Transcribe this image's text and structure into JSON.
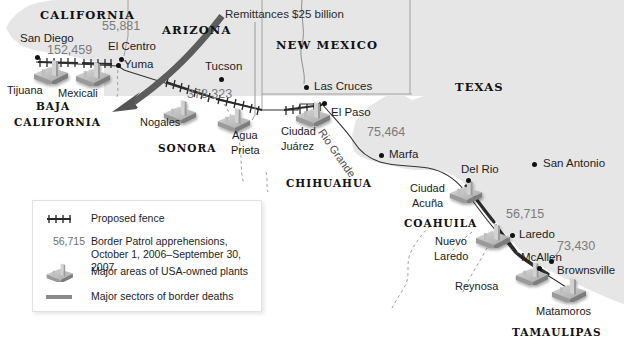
{
  "figure": {
    "kind": "thematic-map",
    "region": "USA-Mexico border",
    "background_color": "#ffffff",
    "us_land_color": "#e6e6e6",
    "mexico_land_color": "#ffffff",
    "accent_gray": "#7b7b7b",
    "border_line_color": "#2b2b2b",
    "arrow_color": "#5e5e5e"
  },
  "annotations": {
    "remittances": "Remittances $25 billion",
    "river": "Rio Grande"
  },
  "us_states": [
    {
      "name": "CALIFORNIA",
      "x": 40,
      "y": 10
    },
    {
      "name": "ARIZONA",
      "x": 160,
      "y": 25
    },
    {
      "name": "NEW MEXICO",
      "x": 278,
      "y": 40
    },
    {
      "name": "TEXAS",
      "x": 455,
      "y": 82
    }
  ],
  "mx_states": [
    {
      "name": "BAJA",
      "x": 34,
      "y": 101
    },
    {
      "name": "CALIFORNIA",
      "x": 14,
      "y": 116
    },
    {
      "name": "SONORA",
      "x": 158,
      "y": 142
    },
    {
      "name": "CHIHUAHUA",
      "x": 286,
      "y": 178
    },
    {
      "name": "COAHUILA",
      "x": 404,
      "y": 218
    },
    {
      "name": "TAMAULIPAS",
      "x": 514,
      "y": 327
    }
  ],
  "us_cities": [
    {
      "name": "San Diego",
      "x": 21,
      "y": 33,
      "dot_x": 35,
      "dot_y": 55
    },
    {
      "name": "El Centro",
      "x": 108,
      "y": 41,
      "dot_x": 119,
      "dot_y": 57
    },
    {
      "name": "Yuma",
      "x": 124,
      "y": 60,
      "dot_x": 117,
      "dot_y": 65
    },
    {
      "name": "Tucson",
      "x": 206,
      "y": 62,
      "dot_x": 219,
      "dot_y": 77
    },
    {
      "name": "Las Cruces",
      "x": 315,
      "y": 82,
      "dot_x": 305,
      "dot_y": 87
    },
    {
      "name": "El Paso",
      "x": 331,
      "y": 108,
      "dot_x": 323,
      "dot_y": 101
    },
    {
      "name": "Marfa",
      "x": 389,
      "y": 149,
      "dot_x": 380,
      "dot_y": 154
    },
    {
      "name": "Del Rio",
      "x": 461,
      "y": 165,
      "dot_x": 465,
      "dot_y": 178
    },
    {
      "name": "San Antonio",
      "x": 543,
      "y": 159,
      "dot_x": 532,
      "dot_y": 164
    },
    {
      "name": "Laredo",
      "x": 519,
      "y": 230,
      "dot_x": 510,
      "dot_y": 235
    },
    {
      "name": "McAllen",
      "x": 523,
      "y": 252,
      "dot_x": 537,
      "dot_y": 266
    },
    {
      "name": "Brownsville",
      "x": 559,
      "y": 265,
      "dot_x": 551,
      "dot_y": 260
    }
  ],
  "mx_cities": [
    {
      "name": "Tijuana",
      "x": 8,
      "y": 85
    },
    {
      "name": "Mexicali",
      "x": 58,
      "y": 88
    },
    {
      "name": "Nogales",
      "x": 141,
      "y": 117
    },
    {
      "name": "Agua",
      "x": 232,
      "y": 130
    },
    {
      "name": "Prieta",
      "x": 231,
      "y": 144
    },
    {
      "name": "Ciudad",
      "x": 281,
      "y": 126
    },
    {
      "name": "Juárez",
      "x": 281,
      "y": 140
    },
    {
      "name": "Ciudad",
      "x": 412,
      "y": 183
    },
    {
      "name": "Acuña",
      "x": 414,
      "y": 197
    },
    {
      "name": "Nuevo",
      "x": 437,
      "y": 236
    },
    {
      "name": "Laredo",
      "x": 436,
      "y": 250
    },
    {
      "name": "Reynosa",
      "x": 457,
      "y": 281
    },
    {
      "name": "Matamoros",
      "x": 538,
      "y": 306
    }
  ],
  "apprehension_numbers": [
    {
      "value": "152,459",
      "x": 47,
      "y": 45
    },
    {
      "value": "55,881",
      "x": 103,
      "y": 21
    },
    {
      "value": "378,323",
      "x": 188,
      "y": 89
    },
    {
      "value": "75,464",
      "x": 368,
      "y": 127
    },
    {
      "value": "56,715",
      "x": 508,
      "y": 209
    },
    {
      "value": "73,430",
      "x": 559,
      "y": 241
    }
  ],
  "legend": {
    "items": [
      {
        "key": "fence-symbol",
        "label": "Proposed fence"
      },
      {
        "key": "number-sample",
        "number": "56,715",
        "label_line1": "Border Patrol apprehensions,",
        "label_line2": "October 1, 2006–September 30, 2007"
      },
      {
        "key": "factory-symbol",
        "label": "Major areas of USA-owned plants"
      },
      {
        "key": "thick-line-symbol",
        "label": "Major sectors of border deaths"
      }
    ]
  }
}
